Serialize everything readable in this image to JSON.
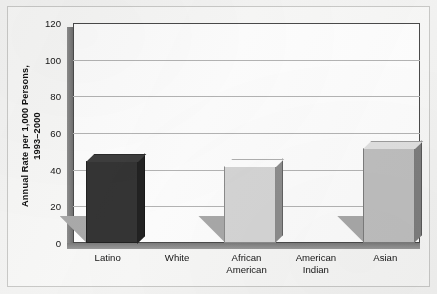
{
  "chart_data": {
    "type": "bar",
    "title": "",
    "subtitle": "",
    "xlabel": "",
    "ylabel": "Annual Rate per 1,000 Persons, 1993–2000",
    "ylabel_lines": [
      "Annual Rate per 1,000 Persons,",
      "1993–2000"
    ],
    "categories": [
      "Latino",
      "White",
      "African American",
      "American Indian",
      "Asian"
    ],
    "category_lines": [
      [
        "Latino"
      ],
      [
        "White"
      ],
      [
        "African",
        "American"
      ],
      [
        "American",
        "Indian"
      ],
      [
        "Asian"
      ]
    ],
    "values": [
      45,
      42,
      52,
      107,
      22
    ],
    "ylim": [
      0,
      120
    ],
    "yticks": [
      0,
      20,
      40,
      60,
      80,
      100,
      120
    ],
    "ytick_labels": [
      "0",
      "20",
      "40",
      "60",
      "80",
      "100",
      "120"
    ],
    "grid": true,
    "grid_axis": "y",
    "legend": false,
    "legend_position": "none",
    "style": "3d-bar",
    "bar_colors": [
      "#343434",
      "#d6d6d6",
      "#bfbfbf",
      "#595959",
      "#4b4b4b"
    ]
  },
  "colors": {
    "page_background": "#f3f3f2",
    "frame_background": "#f7f7f6",
    "frame_border": "#c9c9c7",
    "plot_background": "#fdfdfd",
    "plot_border": "#4a4a4a",
    "gridline": "#b4b4b4",
    "axis_wall": "#7b7b7b",
    "bar_shadow_wedge": "#a9a9a9",
    "text": "#141414"
  }
}
